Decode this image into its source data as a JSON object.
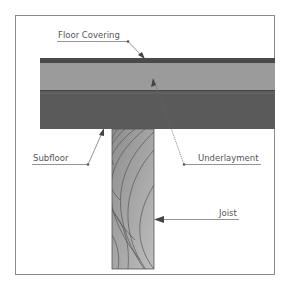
{
  "labels": {
    "floor_covering": "Floor Covering",
    "underlayment": "Underlayment",
    "subfloor": "Subfloor",
    "joist": "Joist"
  },
  "colors": {
    "floor_covering": "#4a4a4a",
    "underlayment": "#9b9b9b",
    "subfloor": "#5a5a5a",
    "joist": "#a8a8a8",
    "grain": "#555555",
    "leader": "#666666",
    "frame": "#8a8a8a"
  }
}
